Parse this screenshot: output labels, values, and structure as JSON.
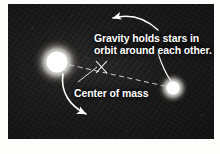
{
  "figure": {
    "kind": "astronomy-diagram",
    "background_color": "#1a1a1a",
    "annotation_color": "#ffffff"
  },
  "annotations": {
    "gravity_note_line1": "Gravity holds stars in",
    "gravity_note_line2": "orbit around each other.",
    "center_of_mass_label": "Center of mass"
  },
  "objects": {
    "primary_star": {
      "name": "large star",
      "cx": 49,
      "cy": 58,
      "core_radius": 11,
      "color": "#ffffff"
    },
    "secondary_star": {
      "name": "small star",
      "cx": 165,
      "cy": 84,
      "core_radius": 7,
      "color": "#ffffff"
    },
    "center_of_mass_marker": {
      "name": "x-marker",
      "cx": 94,
      "cy": 64,
      "color": "#ffffff"
    },
    "separation_line": {
      "style": "dashed",
      "color": "#ffffff"
    }
  },
  "arrows": {
    "orbit_arrow": {
      "direction": "up-left",
      "style": "curved"
    },
    "star_arrow": {
      "direction": "down-right",
      "style": "curved"
    },
    "com_leader": {
      "style": "straight-thin"
    },
    "secondary_leader": {
      "style": "curved-thin"
    }
  }
}
